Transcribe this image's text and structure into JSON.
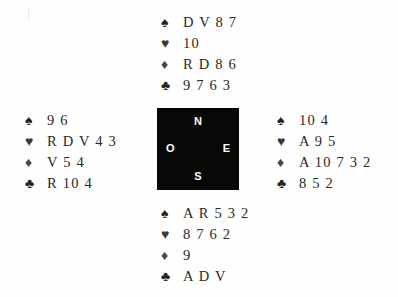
{
  "diagram": {
    "notation": "French",
    "suit_glyphs": {
      "spade": "♠",
      "heart": "♥",
      "diamond": "♦",
      "club": "♣"
    },
    "colors": {
      "background": "#fefefe",
      "compass_box": "#080807",
      "compass_text": "#ffffff",
      "card_text": "#2b2825"
    }
  },
  "compass": {
    "north": "N",
    "east": "E",
    "south": "S",
    "west": "O"
  },
  "hands": {
    "north": {
      "position_label": "N",
      "spades": "D V 8 7",
      "hearts": "10",
      "diamonds": "R D 8 6",
      "clubs": "9 7 6 3"
    },
    "west": {
      "position_label": "O",
      "spades": "9 6",
      "hearts": "R D V 4 3",
      "diamonds": "V 5 4",
      "clubs": "R 10 4"
    },
    "east": {
      "position_label": "E",
      "spades": "10 4",
      "hearts": "A 9 5",
      "diamonds": "A 10 7 3 2",
      "clubs": "8 5 2"
    },
    "south": {
      "position_label": "S",
      "spades": "A R 5 3 2",
      "hearts": "8 7 6 2",
      "diamonds": "9",
      "clubs": "A D V"
    }
  }
}
